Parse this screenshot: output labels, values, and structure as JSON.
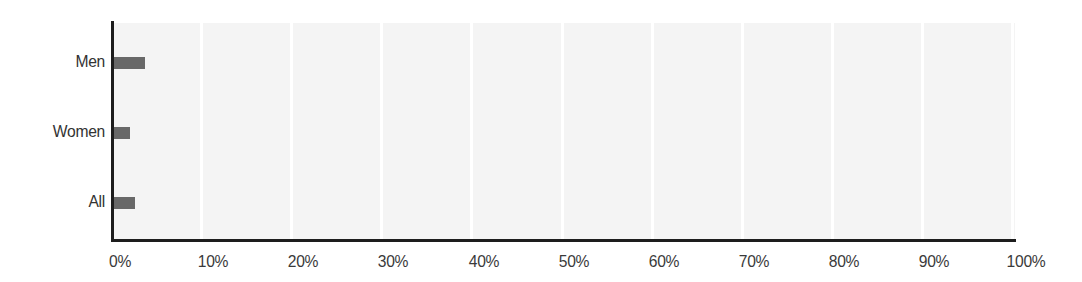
{
  "chart_data": {
    "type": "bar",
    "orientation": "horizontal",
    "title": "",
    "subtitle": "",
    "xlabel": "",
    "ylabel": "",
    "categories": [
      "Men",
      "Women",
      "All"
    ],
    "values": [
      3.5,
      1.9,
      2.4
    ],
    "value_unit": "%",
    "xlim": [
      0,
      100
    ],
    "x_ticks": [
      0,
      10,
      20,
      30,
      40,
      50,
      60,
      70,
      80,
      90,
      100
    ],
    "x_tick_labels": [
      "0%",
      "10%",
      "20%",
      "30%",
      "40%",
      "50%",
      "60%",
      "70%",
      "80%",
      "90%",
      "100%"
    ],
    "grid": "vertical",
    "legend": "none",
    "series": [
      {
        "name": "",
        "values": [
          3.5,
          1.9,
          2.4
        ]
      }
    ],
    "colors": {
      "bar": "#686868",
      "plot_background": "#f4f4f4",
      "gridline": "#ffffff",
      "axis": "#1d1d1d",
      "tick_text": "#3a3a3a",
      "category_text": "#333333",
      "figure_background": "#ffffff"
    }
  }
}
